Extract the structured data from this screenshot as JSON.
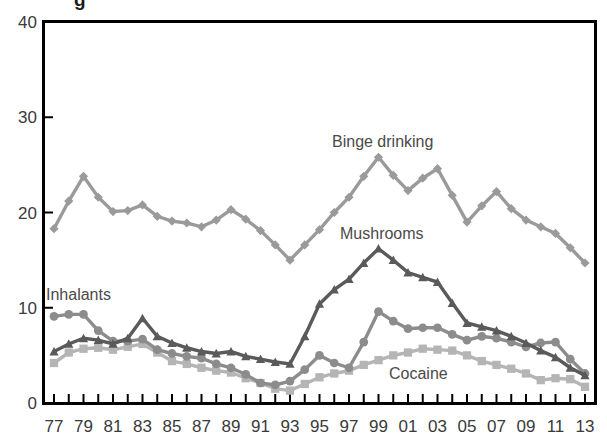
{
  "figure": {
    "title_fragment": "g",
    "background_color": "#ffffff",
    "frame_color": "#000000"
  },
  "chart_data": {
    "type": "line",
    "title": "",
    "xlabel": "",
    "ylabel": "",
    "ylim": [
      0,
      40
    ],
    "yticks": [
      0,
      10,
      20,
      30,
      40
    ],
    "ytick_labels": [
      "0",
      "10",
      "20",
      "30",
      "40"
    ],
    "grid": false,
    "legend_position": "inline-annotations",
    "x": [
      77,
      78,
      79,
      80,
      81,
      82,
      83,
      84,
      85,
      86,
      87,
      88,
      89,
      90,
      91,
      92,
      93,
      94,
      95,
      96,
      97,
      98,
      99,
      0,
      1,
      2,
      3,
      4,
      5,
      6,
      7,
      8,
      9,
      10,
      11,
      12,
      13
    ],
    "xtick_labels": [
      "77",
      "79",
      "81",
      "83",
      "85",
      "87",
      "89",
      "91",
      "93",
      "95",
      "97",
      "99",
      "01",
      "03",
      "05",
      "07",
      "09",
      "11",
      "13"
    ],
    "xtick_label_step": 2,
    "series": [
      {
        "name": "Binge drinking",
        "color": "#9a9a9a",
        "marker": "diamond",
        "values": [
          18.3,
          21.2,
          23.8,
          21.6,
          20.1,
          20.2,
          20.8,
          19.6,
          19.1,
          18.9,
          18.5,
          19.2,
          20.3,
          19.3,
          18.1,
          16.6,
          15.0,
          16.6,
          18.2,
          20.0,
          21.6,
          23.8,
          25.8,
          23.9,
          22.3,
          23.6,
          24.6,
          21.8,
          19.0,
          20.7,
          22.2,
          20.4,
          19.2,
          18.5,
          17.8,
          16.3,
          14.7
        ]
      },
      {
        "name": "Mushrooms",
        "color": "#5a5a5a",
        "marker": "triangle",
        "values": [
          5.4,
          6.2,
          6.8,
          6.6,
          6.2,
          6.8,
          8.9,
          7.0,
          6.3,
          5.8,
          5.4,
          5.2,
          5.4,
          4.9,
          4.6,
          4.3,
          4.1,
          7.0,
          10.4,
          11.9,
          13.0,
          14.7,
          16.2,
          15.0,
          13.7,
          13.2,
          12.7,
          10.5,
          8.4,
          8.0,
          7.6,
          7.0,
          6.3,
          5.5,
          4.8,
          3.7,
          2.9
        ]
      },
      {
        "name": "Inhalants",
        "color": "#8c8c8c",
        "marker": "circle",
        "values": [
          9.1,
          9.3,
          9.3,
          7.6,
          6.5,
          6.5,
          6.7,
          5.6,
          5.2,
          4.9,
          4.7,
          4.1,
          3.7,
          3.0,
          2.1,
          1.9,
          2.3,
          3.5,
          5.0,
          4.2,
          3.7,
          6.4,
          9.6,
          8.6,
          7.8,
          7.9,
          7.9,
          7.2,
          6.6,
          7.0,
          6.8,
          6.4,
          5.9,
          6.3,
          6.4,
          4.6,
          3.1
        ]
      },
      {
        "name": "Cocaine",
        "color": "#b5b5b5",
        "marker": "square",
        "values": [
          4.2,
          5.3,
          5.7,
          5.8,
          5.6,
          5.9,
          6.2,
          5.3,
          4.4,
          4.1,
          3.7,
          3.4,
          3.2,
          2.6,
          2.1,
          1.5,
          1.3,
          2.0,
          2.7,
          3.1,
          3.4,
          4.0,
          4.5,
          5.0,
          5.3,
          5.7,
          5.6,
          5.5,
          5.0,
          4.4,
          4.0,
          3.6,
          3.1,
          2.4,
          2.6,
          2.5,
          1.7
        ]
      }
    ],
    "annotations": [
      {
        "text": "Binge drinking",
        "x_px": 332,
        "y_px": 147,
        "series": "Binge drinking"
      },
      {
        "text": "Mushrooms",
        "x_px": 340,
        "y_px": 239,
        "series": "Mushrooms"
      },
      {
        "text": "Inhalants",
        "x_px": 46,
        "y_px": 300,
        "series": "Inhalants"
      },
      {
        "text": "Cocaine",
        "x_px": 389,
        "y_px": 379,
        "series": "Cocaine"
      }
    ]
  }
}
